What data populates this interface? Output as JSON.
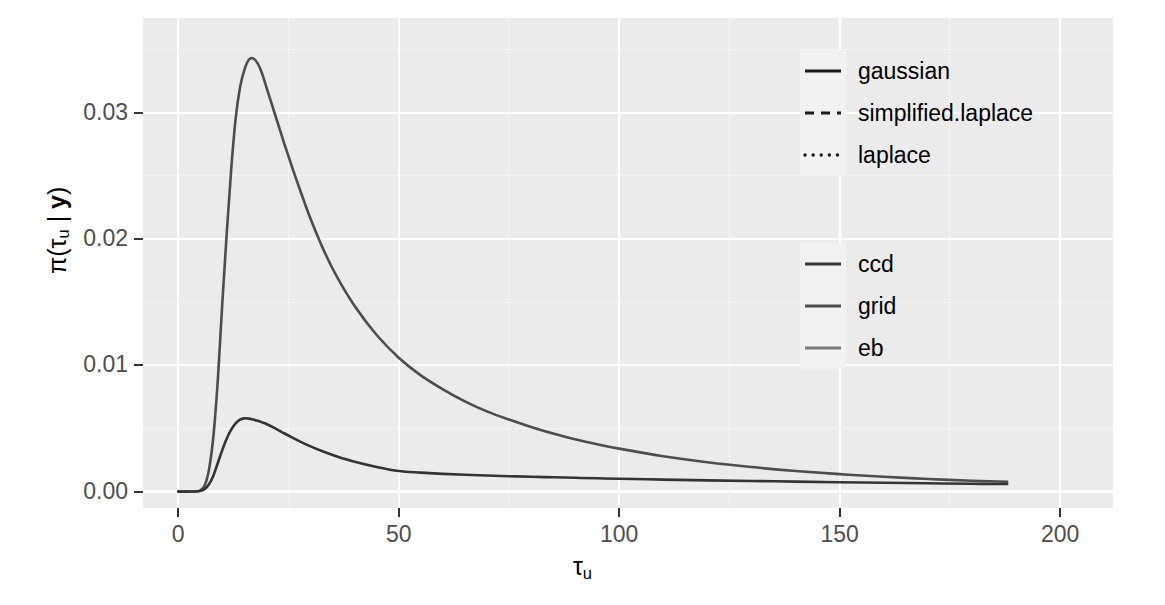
{
  "chart_data": {
    "type": "line",
    "title": "",
    "xlabel": "tau_u",
    "ylabel": "pi(tau_u | y)",
    "xlabel_html": "τ<sub>u</sub>",
    "ylabel_html": "π(τ<sub>u</sub> | <b>y</b>)",
    "xlim": [
      -8,
      212
    ],
    "ylim": [
      -0.0013,
      0.0375
    ],
    "xticks": [
      0,
      50,
      100,
      150,
      200
    ],
    "xtick_labels": [
      "0",
      "50",
      "100",
      "150",
      "200"
    ],
    "yticks": [
      0.0,
      0.01,
      0.02,
      0.03
    ],
    "ytick_labels": [
      "0.00",
      "0.01",
      "0.02",
      "0.03"
    ],
    "x_minor_ticks": [
      25,
      75,
      125,
      175
    ],
    "y_minor_ticks": [
      0.005,
      0.015,
      0.025,
      0.035
    ],
    "grid": true,
    "panel_background": "#ebebeb",
    "gridline_colour": "#ffffff",
    "legend_position": "right",
    "series": [
      {
        "name": "grid-tall-peak",
        "colour": "#4d4d4d",
        "linetype": "solid",
        "x": [
          0,
          2,
          4,
          5,
          6,
          7,
          8,
          9,
          10,
          11,
          12,
          13,
          14,
          15,
          16,
          17,
          18,
          19,
          20,
          22,
          24,
          26,
          28,
          30,
          33,
          36,
          40,
          45,
          50,
          55,
          60,
          65,
          70,
          75,
          80,
          85,
          90,
          95,
          100,
          110,
          120,
          130,
          140,
          150,
          160,
          170,
          180,
          188
        ],
        "y": [
          0.0,
          0.0,
          2e-05,
          0.0001,
          0.0005,
          0.0018,
          0.0045,
          0.009,
          0.015,
          0.0205,
          0.0255,
          0.0295,
          0.032,
          0.0334,
          0.0342,
          0.0343,
          0.0339,
          0.0331,
          0.032,
          0.0298,
          0.0276,
          0.0255,
          0.0235,
          0.0216,
          0.0191,
          0.017,
          0.0147,
          0.0124,
          0.0106,
          0.0092,
          0.0081,
          0.00715,
          0.00635,
          0.0057,
          0.00512,
          0.0046,
          0.00415,
          0.00375,
          0.0034,
          0.0028,
          0.00232,
          0.00194,
          0.00163,
          0.00138,
          0.00118,
          0.001,
          0.00086,
          0.00078
        ]
      },
      {
        "name": "ccd-low-peak",
        "colour": "#333333",
        "linetype": "solid",
        "x": [
          0,
          2,
          4,
          5,
          6,
          7,
          8,
          9,
          10,
          11,
          12,
          13,
          14,
          15,
          16,
          17,
          18,
          19,
          20,
          22,
          24,
          26,
          28,
          30,
          33,
          36,
          40,
          45,
          50,
          55,
          60,
          65,
          70,
          75,
          80,
          85,
          90,
          95,
          100,
          110,
          120,
          130,
          140,
          150,
          160,
          170,
          180,
          188
        ],
        "y": [
          0.0,
          0.0,
          1e-05,
          5e-05,
          0.0002,
          0.0006,
          0.0013,
          0.0023,
          0.0033,
          0.0042,
          0.0049,
          0.0054,
          0.0057,
          0.0058,
          0.00578,
          0.0057,
          0.0056,
          0.00548,
          0.00535,
          0.005,
          0.00462,
          0.00425,
          0.0039,
          0.00358,
          0.00315,
          0.00278,
          0.00236,
          0.00195,
          0.00163,
          0.0015,
          0.0014,
          0.00133,
          0.00127,
          0.00122,
          0.00117,
          0.00113,
          0.00109,
          0.00105,
          0.00102,
          0.00095,
          0.00089,
          0.00084,
          0.00079,
          0.00074,
          0.0007,
          0.00066,
          0.00062,
          0.0006
        ]
      }
    ]
  },
  "legends": [
    {
      "name": "linetype-legend",
      "title": "",
      "items": [
        {
          "label": "gaussian",
          "linetype": "solid",
          "colour": "#1a1a1a"
        },
        {
          "label": "simplified.laplace",
          "linetype": "dashed",
          "colour": "#1a1a1a"
        },
        {
          "label": "laplace",
          "linetype": "dotted",
          "colour": "#1a1a1a"
        }
      ]
    },
    {
      "name": "colour-legend",
      "title": "",
      "items": [
        {
          "label": "ccd",
          "linetype": "solid",
          "colour": "#333333"
        },
        {
          "label": "grid",
          "linetype": "solid",
          "colour": "#4d4d4d"
        },
        {
          "label": "eb",
          "linetype": "solid",
          "colour": "#7a7a7a"
        }
      ]
    }
  ],
  "colors": {
    "panel": "#ebebeb",
    "grid_major": "#ffffff",
    "grid_minor": "#f5f5f5",
    "axis_text": "#4d4d4d",
    "axis_title": "#000000",
    "legend_key": "#f2f2f2",
    "page_background": "#ffffff"
  }
}
